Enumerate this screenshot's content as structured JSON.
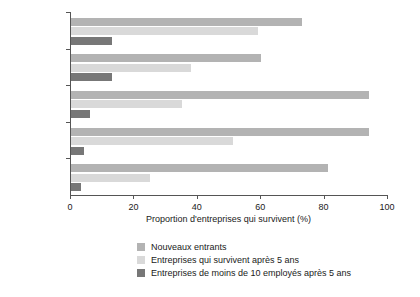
{
  "chart_data": {
    "type": "bar",
    "orientation": "horizontal",
    "title": "",
    "xlabel": "Proportion d'entreprises qui survivent (%)",
    "ylabel": "",
    "xlim": [
      0,
      100
    ],
    "xticks": [
      0,
      20,
      40,
      60,
      80,
      100
    ],
    "grid": false,
    "legend_position": "bottom",
    "categories": [
      "Vietnam",
      "Afrique du Sud",
      "Moldavie",
      "Kosovo",
      "Côte d'Ivoire"
    ],
    "series": [
      {
        "name": "Nouveaux entrants",
        "color": "#b3b3b3",
        "values": [
          73,
          60,
          94,
          94,
          81
        ]
      },
      {
        "name": "Entreprises qui survivent après 5 ans",
        "color": "#d9d9d9",
        "values": [
          59,
          38,
          35,
          51,
          25
        ]
      },
      {
        "name": "Entreprises de moins de 10 employés après 5 ans",
        "color": "#777777",
        "values": [
          13,
          13,
          6,
          4,
          3
        ]
      }
    ]
  }
}
